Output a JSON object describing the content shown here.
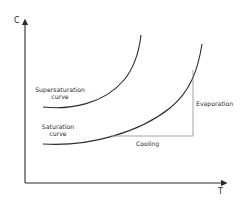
{
  "diagram": {
    "axes": {
      "y_label": "C",
      "x_label": "T"
    },
    "curves": [
      {
        "name": "supersaturation",
        "label_line1": "Supersaturation",
        "label_line2": "curve"
      },
      {
        "name": "saturation",
        "label_line1": "Saturation",
        "label_line2": "curve"
      }
    ],
    "processes": {
      "evaporation": "Evaporation",
      "cooling": "Cooling"
    },
    "colors": {
      "axis": "#2b2b2b",
      "curve": "#2b2b2b",
      "process_line": "#8a8a8a",
      "text": "#2a2a2a",
      "background": "#ffffff"
    }
  }
}
